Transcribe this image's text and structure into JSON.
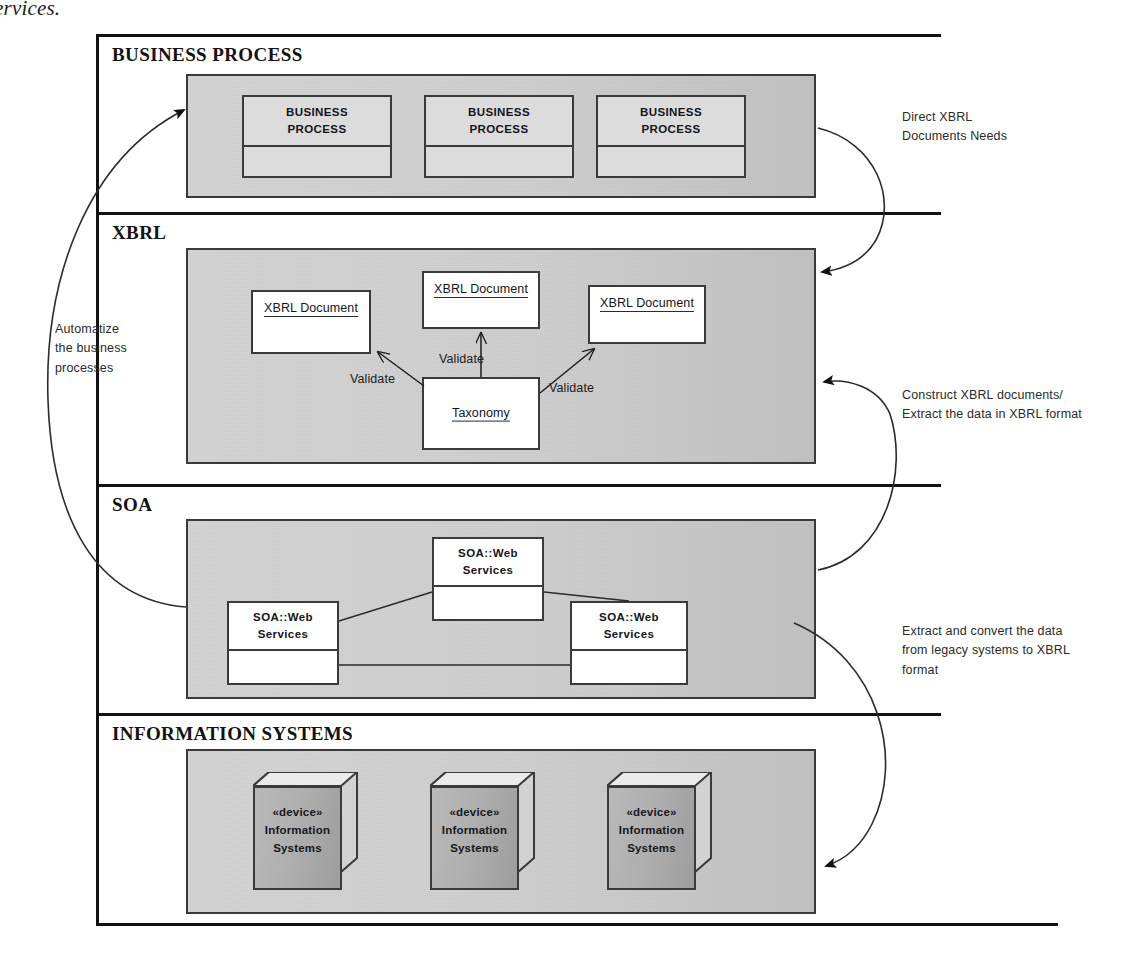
{
  "caption_fragment": "ervices.",
  "bands": [
    {
      "id": "business-process",
      "title": "BUSINESS PROCESS"
    },
    {
      "id": "xbrl",
      "title": "XBRL"
    },
    {
      "id": "soa",
      "title": "SOA"
    },
    {
      "id": "information-systems",
      "title": "INFORMATION SYSTEMS"
    }
  ],
  "business_process": {
    "nodes": [
      {
        "line1": "BUSINESS",
        "line2": "PROCESS"
      },
      {
        "line1": "BUSINESS",
        "line2": "PROCESS"
      },
      {
        "line1": "BUSINESS",
        "line2": "PROCESS"
      }
    ]
  },
  "xbrl": {
    "documents": [
      {
        "name": "XBRL Document"
      },
      {
        "name": "XBRL Document"
      },
      {
        "name": "XBRL Document"
      }
    ],
    "taxonomy": {
      "name": "Taxonomy"
    },
    "edges": [
      {
        "label": "Validate"
      },
      {
        "label": "Validate"
      },
      {
        "label": "Validate"
      }
    ]
  },
  "soa": {
    "nodes": [
      {
        "line1": "SOA::Web",
        "line2": "Services"
      },
      {
        "line1": "SOA::Web",
        "line2": "Services"
      },
      {
        "line1": "SOA::Web",
        "line2": "Services"
      }
    ]
  },
  "information_systems": {
    "nodes": [
      {
        "stereotype": "«device»",
        "line1": "Information",
        "line2": "Systems"
      },
      {
        "stereotype": "«device»",
        "line1": "Information",
        "line2": "Systems"
      },
      {
        "stereotype": "«device»",
        "line1": "Information",
        "line2": "Systems"
      }
    ]
  },
  "annotations": {
    "left": "Automatize\nthe business\nprocesses",
    "right_top": "Direct XBRL\nDocuments Needs",
    "right_middle": "Construct XBRL documents/\nExtract the data in XBRL format",
    "right_bottom": "Extract and convert the data\nfrom legacy systems to XBRL\nformat"
  },
  "colors": {
    "line": "#121212",
    "panel_border": "#3a3a3a",
    "panel_fill": "#cfcfcf",
    "node_fill": "#dcdcdc",
    "device_fill": "#aeaeae",
    "white": "#ffffff"
  }
}
